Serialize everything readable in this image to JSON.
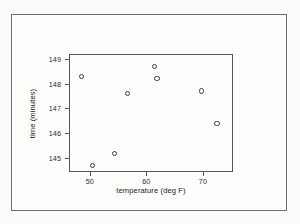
{
  "figure": {
    "background_color": "#fdfdfc",
    "frame_color": "#6f6f70",
    "axis_color": "#58585a",
    "marker_color": "#3a3a3c"
  },
  "chart_data": {
    "type": "scatter",
    "title": "",
    "xlabel": "temperature (deg F)",
    "ylabel": "time (minutes)",
    "xlim": [
      46.5,
      75.5
    ],
    "ylim": [
      144.4,
      149.15
    ],
    "xticks": [
      50,
      60,
      70
    ],
    "yticks": [
      145,
      146,
      147,
      148,
      149
    ],
    "xtick_labels": [
      "50",
      "60",
      "70"
    ],
    "ytick_labels": [
      "145",
      "146",
      "147",
      "148",
      "149"
    ],
    "grid": false,
    "legend": null,
    "marker": "open-circle",
    "x": [
      48.5,
      50.5,
      54.3,
      56.6,
      61.5,
      61.9,
      69.8,
      72.5
    ],
    "y": [
      148.3,
      144.7,
      145.2,
      147.6,
      148.7,
      148.2,
      147.7,
      146.4
    ],
    "points": [
      {
        "x": 48.5,
        "y": 148.3
      },
      {
        "x": 50.5,
        "y": 144.7
      },
      {
        "x": 54.3,
        "y": 145.2
      },
      {
        "x": 56.6,
        "y": 147.6
      },
      {
        "x": 61.5,
        "y": 148.7
      },
      {
        "x": 61.9,
        "y": 148.2
      },
      {
        "x": 69.8,
        "y": 147.7
      },
      {
        "x": 72.5,
        "y": 146.4
      }
    ]
  }
}
